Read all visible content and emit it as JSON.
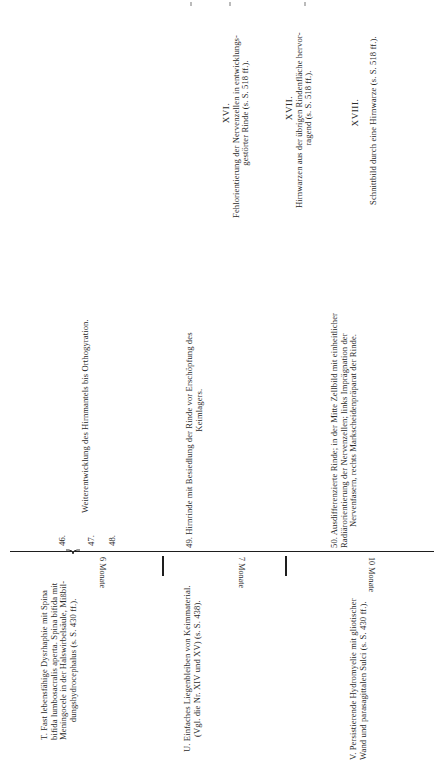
{
  "page": {
    "orientation": "rotated-90",
    "timeline": {
      "sections": [
        {
          "age_label": "6 Monate",
          "case": {
            "letter": "T.",
            "lines": [
              "T.  Fast  lebensfähige  Dysrhaphie  mit  Spina",
              "bifida lumbosacralis aperta.  Spina bifida mit",
              "Meningocele  in  der  Halswirbelsäule,  Mißbil-",
              "dungshydrocephalus (s. S. 430 ff.)."
            ]
          },
          "entries": [
            {
              "number": "46.",
              "text": ""
            },
            {
              "number": "47.",
              "text": "Weiterentwicklung  des  Hirnmantels  bis  Orthogyration."
            },
            {
              "number": "48.",
              "text": ""
            }
          ]
        },
        {
          "age_label": "7 Monate",
          "case": {
            "letter": "U.",
            "lines": [
              "U. Einfaches Liegenbleiben von Keimmaterial.",
              "(Vgl. die Nr. XIV und XV) (s. S. 438)."
            ]
          },
          "entries": [
            {
              "number": "49.",
              "lines": [
                "49.  Hirnrinde  mit  Besiedlung  der  Rinde  vor  Erschöpfung  des",
                "Keimlagers."
              ]
            }
          ]
        },
        {
          "age_label": "10 Monate",
          "case": {
            "letter": "V.",
            "lines": [
              "V. Persistierende  Hydromyelie  mit  gliotischer",
              "Wand  und  parasagittalen  Sulci  (s. S. 430 ff.)."
            ]
          },
          "entries": [
            {
              "number": "50.",
              "lines": [
                "50. Ausdifferenzierte  Rinde;  in der  Mitte  Zellbild  mit einheitlicher",
                "Radiärorientierung  der  Nervenzellen;  links  Imprägnation  der",
                "Nervenfasern,  rechts  Markscheidenpräparat  der  Rinde."
              ]
            }
          ]
        }
      ]
    },
    "plates": [
      {
        "numeral": "XVI.",
        "lines": [
          "Fehlorientierung der Nervenzellen in entwicklungs-",
          "gestörter  Rinde  (s. S. 518 ff.)."
        ]
      },
      {
        "numeral": "XVII.",
        "lines": [
          "Hirnwarzen aus der übrigen Rindenfläche hervor-",
          "ragend  (s. S. 518 ff.)."
        ]
      },
      {
        "numeral": "XVIII.",
        "lines": [
          "Schnittbild  durch  eine  Hirnwarze  (s. S. 518 ff.)."
        ]
      }
    ],
    "colors": {
      "text": "#2a2a2a",
      "rule": "#1e1e1e",
      "background": "#ffffff"
    }
  }
}
